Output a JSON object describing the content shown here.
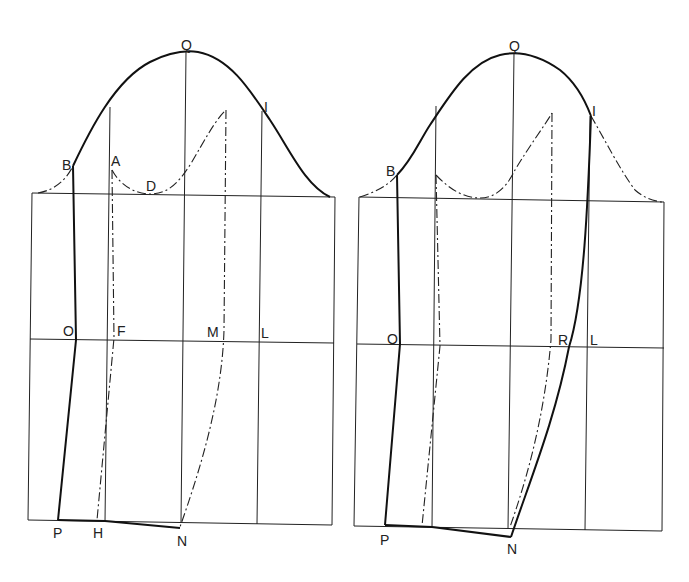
{
  "diagram": {
    "type": "sleeve-pattern-draft",
    "panels": [
      {
        "id": "left",
        "labels": {
          "Q": "Q",
          "I": "I",
          "B": "B",
          "A": "A",
          "D": "D",
          "O": "O",
          "F": "F",
          "M": "M",
          "L": "L",
          "P": "P",
          "H": "H",
          "N": "N"
        }
      },
      {
        "id": "right",
        "labels": {
          "Q": "Q",
          "I": "I",
          "B": "B",
          "O": "O",
          "R": "R",
          "L": "L",
          "P": "P",
          "N": "N"
        }
      }
    ],
    "colors": {
      "line": "#222222",
      "background": "#ffffff"
    }
  }
}
